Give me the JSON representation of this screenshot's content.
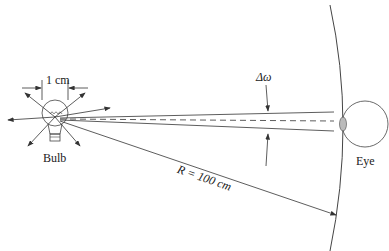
{
  "diagram": {
    "labels": {
      "width": "1 cm",
      "bulb": "Bulb",
      "eye": "Eye",
      "delta_omega": "Δω",
      "radius": "R = 100 cm"
    },
    "colors": {
      "line": "#333333",
      "background": "#ffffff",
      "lens": "#999999"
    }
  }
}
